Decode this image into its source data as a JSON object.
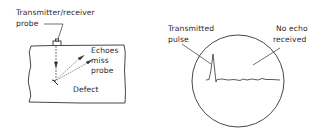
{
  "left_panel": {
    "probe_label_line1": "Transmitter/receiver",
    "probe_label_line2": "probe",
    "echo_label_line1": "Echoes",
    "echo_label_line2": "miss",
    "echo_label_line3": "probe",
    "defect_label": "Defect"
  },
  "right_panel": {
    "pulse_label_line1": "Transmitted",
    "pulse_label_line2": "pulse",
    "no_echo_label_line1": "No echo",
    "no_echo_label_line2": "received"
  },
  "colors": {
    "ink": "#2a2a2a",
    "background": "#ffffff"
  }
}
